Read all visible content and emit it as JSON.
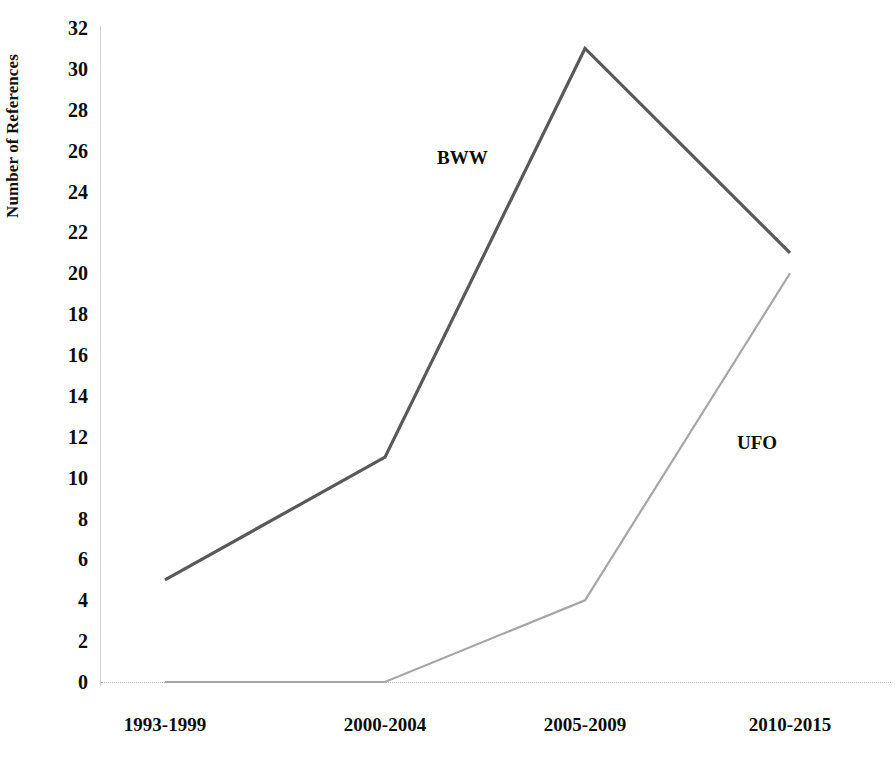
{
  "chart_data": {
    "type": "line",
    "title": "",
    "subtitle": "",
    "xlabel": "",
    "ylabel": "Number of References",
    "categories": [
      "1993-1999",
      "2000-2004",
      "2005-2009",
      "2010-2015"
    ],
    "series": [
      {
        "name": "BWW",
        "values": [
          5,
          11,
          31,
          21
        ],
        "color": "#595959"
      },
      {
        "name": "UFO",
        "values": [
          0,
          0,
          4,
          20
        ],
        "color": "#a6a6a6"
      }
    ],
    "ylim": [
      0,
      32
    ],
    "ytick_labels": [
      "0",
      "2",
      "4",
      "6",
      "8",
      "10",
      "12",
      "14",
      "16",
      "18",
      "20",
      "22",
      "24",
      "26",
      "28",
      "30",
      "32"
    ],
    "ytick_values": [
      0,
      2,
      4,
      6,
      8,
      10,
      12,
      14,
      16,
      18,
      20,
      22,
      24,
      26,
      28,
      30,
      32
    ],
    "grid": false,
    "zero_gridline": true,
    "legend": "inline-series-labels",
    "legend_position": "none",
    "annotations": [
      {
        "text": "BWW",
        "series": "BWW"
      },
      {
        "text": "UFO",
        "series": "UFO"
      }
    ]
  },
  "axes": {
    "y_title": "Number of References",
    "y_labels": [
      "32",
      "30",
      "28",
      "26",
      "24",
      "22",
      "20",
      "18",
      "16",
      "14",
      "12",
      "10",
      "8",
      "6",
      "4",
      "2",
      "0"
    ],
    "x_labels": [
      "1993-1999",
      "2000-2004",
      "2005-2009",
      "2010-2015"
    ]
  },
  "series_labels": {
    "bww": "BWW",
    "ufo": "UFO"
  },
  "colors": {
    "bww_line": "#595959",
    "ufo_line": "#a6a6a6",
    "axis": "#d2d2d2",
    "gridline": "#b9b9b9",
    "text": "#0d0d0d",
    "background": "#ffffff"
  }
}
